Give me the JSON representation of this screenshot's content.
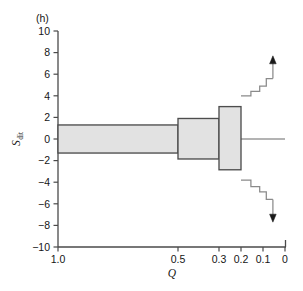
{
  "panel": {
    "label": "(h)"
  },
  "chart_data": {
    "type": "box",
    "title": "",
    "subtitle": "",
    "panel_label": "(h)",
    "xlabel": "Q",
    "ylabel": "S_dit",
    "ylabel_main": "S",
    "ylabel_sub": "dit",
    "xlim": [
      1.0,
      0.0
    ],
    "ylim": [
      -10,
      10
    ],
    "grid": false,
    "legend": null,
    "x_reversed": true,
    "x_tick_labels": [
      "1.0",
      "0.5",
      "0.3",
      "0.2",
      "0.1",
      "0"
    ],
    "x_tick_values": [
      1.0,
      0.5,
      0.3,
      0.2,
      0.1,
      0.0
    ],
    "x_tick_pixels": [
      58,
      178,
      219,
      241,
      263,
      285
    ],
    "y_tick_labels": [
      "10",
      "8",
      "6",
      "4",
      "2",
      "0",
      "-2",
      "-4",
      "-6",
      "-8",
      "-10"
    ],
    "y_tick_values": [
      10,
      8,
      6,
      4,
      2,
      0,
      -2,
      -4,
      -6,
      -8,
      -10
    ],
    "boxes": [
      {
        "q_start": 1.0,
        "q_end": 0.5,
        "upper": 1.3,
        "lower": -1.3
      },
      {
        "q_start": 0.5,
        "q_end": 0.3,
        "upper": 1.9,
        "lower": -1.85
      },
      {
        "q_start": 0.3,
        "q_end": 0.2,
        "upper": 3.0,
        "lower": -2.85
      }
    ],
    "upper_steps": [
      {
        "q_start": 0.2,
        "q_end": 0.155,
        "value": 4.0
      },
      {
        "q_start": 0.155,
        "q_end": 0.115,
        "value": 4.4
      },
      {
        "q_start": 0.115,
        "q_end": 0.085,
        "value": 4.9
      },
      {
        "q_start": 0.085,
        "q_end": 0.055,
        "value": 5.6
      }
    ],
    "lower_steps": [
      {
        "q_start": 0.2,
        "q_end": 0.155,
        "value": -3.8
      },
      {
        "q_start": 0.155,
        "q_end": 0.115,
        "value": -4.4
      },
      {
        "q_start": 0.115,
        "q_end": 0.085,
        "value": -4.9
      },
      {
        "q_start": 0.085,
        "q_end": 0.055,
        "value": -5.6
      }
    ],
    "arrows": [
      {
        "direction": "up",
        "q": 0.055,
        "from": 5.6,
        "to": 7.7
      },
      {
        "direction": "down",
        "q": 0.055,
        "from": -5.6,
        "to": -7.7
      }
    ],
    "zero_line": {
      "y": 0,
      "q_start": 1.0,
      "q_end": 0.0
    },
    "colors": {
      "box_fill": "#e2e2e2",
      "box_stroke": "#4d4d4d",
      "axis": "#4a4a4a",
      "step_line": "#8a8a8a",
      "zero_line": "#9a9a9a",
      "arrow": "#1a1a1a",
      "text": "#151515",
      "background": "#ffffff"
    }
  }
}
